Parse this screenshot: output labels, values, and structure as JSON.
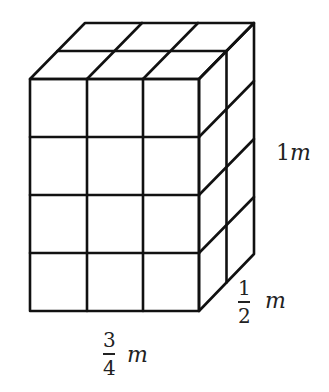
{
  "figure": {
    "type": "cuboid made of unit cubes",
    "grid": {
      "front_columns": 3,
      "rows": 4,
      "depth_columns": 2
    },
    "stroke_color": "#111111",
    "labels": {
      "height": {
        "value": "1",
        "unit": "m"
      },
      "depth": {
        "numerator": "1",
        "denominator": "2",
        "unit": "m"
      },
      "width": {
        "numerator": "3",
        "denominator": "4",
        "unit": "m"
      }
    }
  }
}
